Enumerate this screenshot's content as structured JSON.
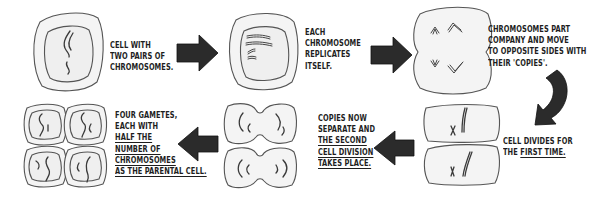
{
  "colors": {
    "outline": "#4a4a4a",
    "cell_fill": "#f2f2f2",
    "arrow_fill": "#2b2b2b",
    "chromosome": "#3a3a3a",
    "text": "#1e1e1e"
  },
  "steps": [
    {
      "id": "step1",
      "lines": [
        {
          "text": "Cell with",
          "underline": false
        },
        {
          "text": "two pairs of",
          "underline": false
        },
        {
          "text": "chromosomes.",
          "underline": false
        }
      ]
    },
    {
      "id": "step2",
      "lines": [
        {
          "text": "Each",
          "underline": false
        },
        {
          "text": "chromosome",
          "underline": false
        },
        {
          "text": "replicates",
          "underline": false
        },
        {
          "text": "itself.",
          "underline": false
        }
      ]
    },
    {
      "id": "step3",
      "lines": [
        {
          "text": "Chromosomes part",
          "underline": false
        },
        {
          "text": "company and move",
          "underline": false
        },
        {
          "text": "to opposite sides with",
          "underline": false
        },
        {
          "text": "their 'copies'.",
          "underline": false
        }
      ]
    },
    {
      "id": "step4",
      "lines": [
        {
          "prefix": "",
          "text": "Cell divides for",
          "underline": false
        },
        {
          "prefix": "the ",
          "text": "first time.",
          "underline": true
        }
      ]
    },
    {
      "id": "step5",
      "lines": [
        {
          "text": "Copies now",
          "underline": false
        },
        {
          "text": "separate and",
          "underline": false
        },
        {
          "text": "the second",
          "underline": true
        },
        {
          "text": "cell division",
          "underline": true
        },
        {
          "text": "takes place.",
          "underline": true
        }
      ]
    },
    {
      "id": "step6",
      "lines": [
        {
          "text": "Four gametes,",
          "underline": false
        },
        {
          "text": "each with",
          "underline": false
        },
        {
          "text": "half the",
          "underline": true
        },
        {
          "text": "number of",
          "underline": true
        },
        {
          "text": "chromosomes",
          "underline": true
        },
        {
          "text": "as the parental cell.",
          "underline": true
        }
      ]
    }
  ],
  "flat": {
    "s1_l1": "Cell with",
    "s1_l2": "two pairs of",
    "s1_l3": "chromosomes.",
    "s2_l1": "Each",
    "s2_l2": "chromosome",
    "s2_l3": "replicates",
    "s2_l4": "itself.",
    "s3_l1": "Chromosomes part",
    "s3_l2": "company and move",
    "s3_l3": "to opposite sides with",
    "s3_l4": "their 'copies'.",
    "s4_l1": "Cell divides for",
    "s4_l2_prefix": "the ",
    "s4_l2_u": "first time.",
    "s5_l1": "Copies now",
    "s5_l2": "separate and",
    "s5_l3": "the second",
    "s5_l4": "cell division",
    "s5_l5": "takes place.",
    "s6_l1": "Four gametes,",
    "s6_l2": "each with",
    "s6_l3": "half the",
    "s6_l4": "number of",
    "s6_l5": "chromosomes",
    "s6_l6": "as the parental cell."
  },
  "icons": {
    "arrow_right": "block-arrow-right-icon",
    "arrow_curved": "curved-arrow-down-icon",
    "arrow_left": "block-arrow-left-icon"
  }
}
